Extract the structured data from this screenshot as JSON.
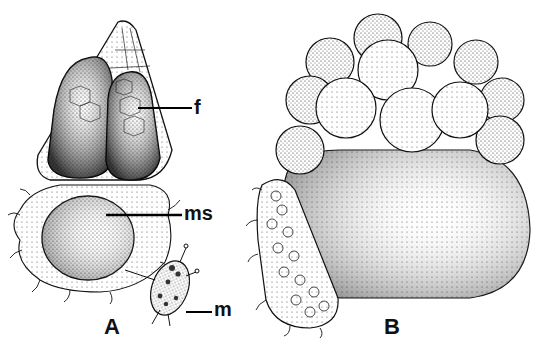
{
  "figure": {
    "panels": [
      {
        "id": "A",
        "label": "A"
      },
      {
        "id": "B",
        "label": "B"
      }
    ],
    "annotations": [
      {
        "label": "f"
      },
      {
        "label": "ms"
      },
      {
        "label": "m"
      }
    ]
  }
}
